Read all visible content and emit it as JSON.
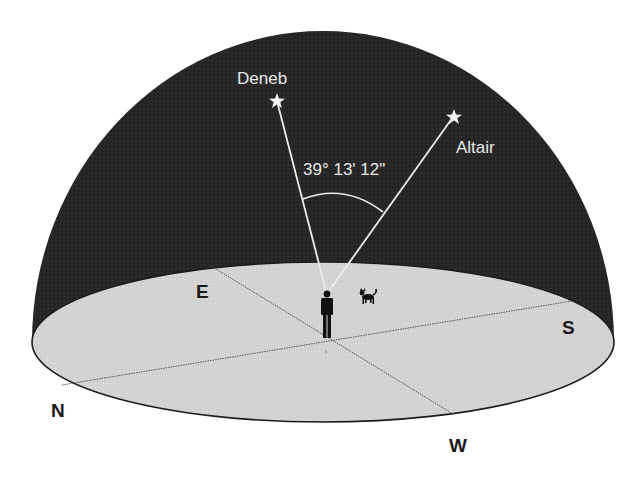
{
  "diagram": {
    "colors": {
      "sky_dome": "#262626",
      "ground_disk": "#d3d3d3",
      "ground_edge": "#1c1c1c",
      "sight_lines": "#ececec",
      "label_light": "#e8e8e8",
      "label_dark": "#1a1a1a",
      "figures": "#111111"
    },
    "stars": [
      {
        "name": "Deneb",
        "label": "Deneb"
      },
      {
        "name": "Altair",
        "label": "Altair"
      }
    ],
    "angle_label": "39° 13' 12\"",
    "directions": {
      "north": "N",
      "east": "E",
      "south": "S",
      "west": "W"
    },
    "figures": {
      "observer": "person-icon",
      "dog": "dog-icon"
    }
  }
}
